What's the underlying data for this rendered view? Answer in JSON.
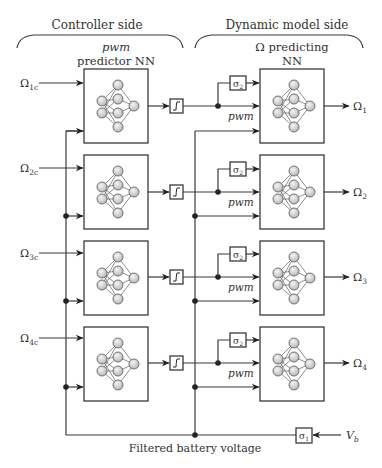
{
  "headers": {
    "controller": "Controller side",
    "dynamic": "Dynamic model side"
  },
  "left_column": {
    "title_line1": "pwm",
    "title_line2": "predictor NN"
  },
  "right_column": {
    "title_line1": "Ω predicting",
    "title_line2": "NN"
  },
  "rows": [
    {
      "input_main": "Ω",
      "input_sub": "1c",
      "output_main": "Ω",
      "output_sub": "1",
      "sigma": "σ",
      "sigma_sub": "2",
      "pwm": "pwm"
    },
    {
      "input_main": "Ω",
      "input_sub": "2c",
      "output_main": "Ω",
      "output_sub": "2",
      "sigma": "σ",
      "sigma_sub": "2",
      "pwm": "pwm"
    },
    {
      "input_main": "Ω",
      "input_sub": "3c",
      "output_main": "Ω",
      "output_sub": "3",
      "sigma": "σ",
      "sigma_sub": "2",
      "pwm": "pwm"
    },
    {
      "input_main": "Ω",
      "input_sub": "4c",
      "output_main": "Ω",
      "output_sub": "4",
      "sigma": "σ",
      "sigma_sub": "2",
      "pwm": "pwm"
    }
  ],
  "battery": {
    "label": "Filtered battery voltage",
    "filter": "σ",
    "filter_sub": "1",
    "source": "V",
    "source_sub": "b"
  }
}
